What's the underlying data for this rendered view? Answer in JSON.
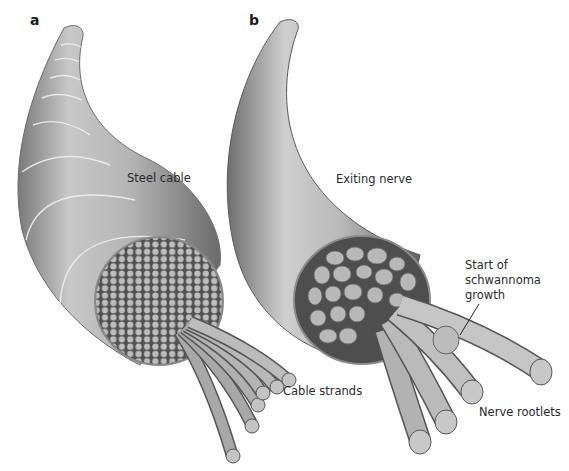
{
  "figure": {
    "panels": [
      {
        "id": "a",
        "letter": "a",
        "labels": {
          "main": "Steel cable",
          "strands": "Cable strands"
        }
      },
      {
        "id": "b",
        "letter": "b",
        "labels": {
          "main": "Exiting nerve",
          "tumor": "Start of schwannoma growth",
          "tumor_lines": [
            "Start of",
            "schwannoma",
            "growth"
          ],
          "rootlets": "Nerve rootlets"
        }
      }
    ],
    "colors": {
      "background": "#ffffff",
      "cable_light": "#d4d4d4",
      "cable_mid": "#a9a9a9",
      "cable_dark": "#6e6e6e",
      "cross_section_bg": "#555555",
      "strand_fill": "#b8b8b8",
      "outline": "#3c3c3c",
      "text": "#2a2a2a"
    }
  }
}
